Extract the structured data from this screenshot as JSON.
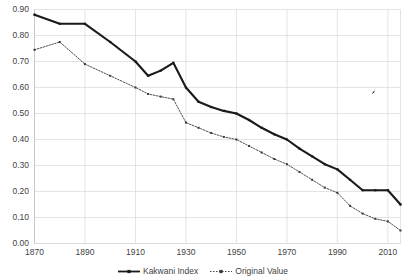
{
  "chart_data": {
    "type": "line",
    "title": "",
    "subtitle": "",
    "xlabel": "",
    "ylabel": "",
    "xlim": [
      1870,
      2015
    ],
    "ylim": [
      0.0,
      0.9
    ],
    "grid": true,
    "grid_axis": "both",
    "legend_position": "bottom-center",
    "xticks": [
      1870,
      1890,
      1910,
      1930,
      1950,
      1970,
      1990,
      2010
    ],
    "xtick_labels": [
      "1870",
      "1890",
      "1910",
      "1930",
      "1950",
      "1970",
      "1990",
      "2010"
    ],
    "yticks": [
      0.0,
      0.1,
      0.2,
      0.3,
      0.4,
      0.5,
      0.6,
      0.7,
      0.8,
      0.9
    ],
    "ytick_labels": [
      "0.00",
      "0.10",
      "0.20",
      "0.30",
      "0.40",
      "0.50",
      "0.60",
      "0.70",
      "0.80",
      "0.90"
    ],
    "series": [
      {
        "name": "Kakwani Index",
        "color": "#1a1a1a",
        "style": "solid",
        "marker": "square",
        "x": [
          1870,
          1880,
          1890,
          1900,
          1910,
          1915,
          1920,
          1925,
          1930,
          1935,
          1940,
          1945,
          1950,
          1955,
          1960,
          1965,
          1970,
          1975,
          1980,
          1985,
          1990,
          1995,
          2000,
          2005,
          2010,
          2015
        ],
        "values": [
          0.88,
          0.845,
          0.845,
          0.775,
          0.7,
          0.645,
          0.665,
          0.695,
          0.6,
          0.545,
          0.525,
          0.51,
          0.5,
          0.475,
          0.445,
          0.42,
          0.4,
          0.365,
          0.335,
          0.305,
          0.285,
          0.245,
          0.205,
          0.205,
          0.205,
          0.15
        ]
      },
      {
        "name": "Original Value",
        "color": "#3a3a3a",
        "style": "dotted",
        "marker": "square",
        "x": [
          1870,
          1880,
          1890,
          1900,
          1910,
          1915,
          1920,
          1925,
          1930,
          1935,
          1940,
          1945,
          1950,
          1955,
          1960,
          1965,
          1970,
          1975,
          1980,
          1985,
          1990,
          1995,
          2000,
          2005,
          2010,
          2015
        ],
        "values": [
          0.745,
          0.775,
          0.69,
          0.645,
          0.6,
          0.575,
          0.565,
          0.555,
          0.465,
          0.445,
          0.425,
          0.41,
          0.4,
          0.375,
          0.35,
          0.325,
          0.305,
          0.275,
          0.245,
          0.215,
          0.195,
          0.145,
          0.115,
          0.095,
          0.085,
          0.05
        ]
      }
    ]
  },
  "legend": {
    "items": [
      {
        "label": "Kakwani Index"
      },
      {
        "label": "Original Value"
      }
    ]
  }
}
